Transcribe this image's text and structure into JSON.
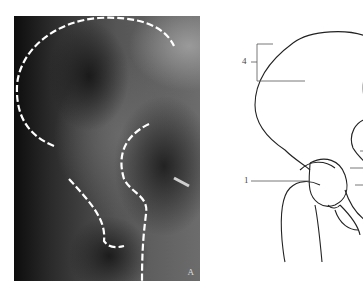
{
  "figure": {
    "panel_a": {
      "type": "radiograph",
      "subject": "pelvis / ilium",
      "marker": "A",
      "outline_style": "white dashed"
    },
    "panel_b": {
      "type": "line-drawing",
      "labels": [
        {
          "id": "label-4",
          "text": "4"
        },
        {
          "id": "label-1",
          "text": "1"
        }
      ]
    }
  }
}
